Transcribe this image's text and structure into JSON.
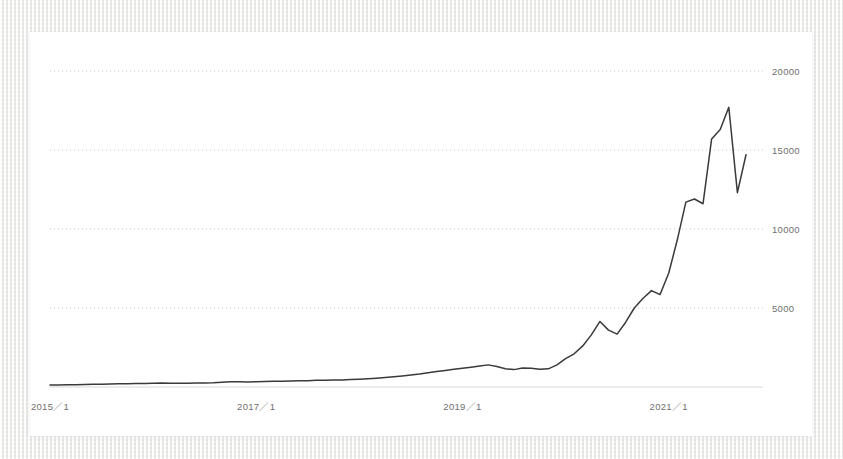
{
  "chart_data": {
    "type": "line",
    "title": "",
    "subtitle": "",
    "xlabel": "",
    "ylabel": "",
    "grid": true,
    "legend": false,
    "legend_position": "none",
    "line_color": "#3a3a3a",
    "gridline_color": "#c9c9c9",
    "background_color": "#ffffff",
    "page_background_color": "#f4f4f2",
    "ylim": [
      0,
      21000
    ],
    "y_ticks": [
      5000,
      10000,
      15000,
      20000
    ],
    "y_tick_labels": [
      "5000",
      "10000",
      "15000",
      "20000"
    ],
    "x_ticks": [
      "2015／1",
      "2017／1",
      "2019／1",
      "2021／1"
    ],
    "x_tick_labels": [
      "2015／1",
      "2017／1",
      "2019／1",
      "2021／1"
    ],
    "x_range": [
      "2015／1",
      "2021／10"
    ],
    "series": [
      {
        "name": "value",
        "x": [
          "2015/1",
          "2015/2",
          "2015/3",
          "2015/4",
          "2015/5",
          "2015/6",
          "2015/7",
          "2015/8",
          "2015/9",
          "2015/10",
          "2015/11",
          "2015/12",
          "2016/1",
          "2016/2",
          "2016/3",
          "2016/4",
          "2016/5",
          "2016/6",
          "2016/7",
          "2016/8",
          "2016/9",
          "2016/10",
          "2016/11",
          "2016/12",
          "2017/1",
          "2017/2",
          "2017/3",
          "2017/4",
          "2017/5",
          "2017/6",
          "2017/7",
          "2017/8",
          "2017/9",
          "2017/10",
          "2017/11",
          "2017/12",
          "2018/1",
          "2018/2",
          "2018/3",
          "2018/4",
          "2018/5",
          "2018/6",
          "2018/7",
          "2018/8",
          "2018/9",
          "2018/10",
          "2018/11",
          "2018/12",
          "2019/1",
          "2019/2",
          "2019/3",
          "2019/4",
          "2019/5",
          "2019/6",
          "2019/7",
          "2019/8",
          "2019/9",
          "2019/10",
          "2019/11",
          "2019/12",
          "2020/1",
          "2020/2",
          "2020/3",
          "2020/4",
          "2020/5",
          "2020/6",
          "2020/7",
          "2020/8",
          "2020/9",
          "2020/10",
          "2020/11",
          "2020/12",
          "2021/1",
          "2021/2",
          "2021/3",
          "2021/4",
          "2021/5",
          "2021/6",
          "2021/7",
          "2021/8",
          "2021/9",
          "2021/10"
        ],
        "values": [
          120,
          130,
          140,
          150,
          160,
          170,
          180,
          190,
          200,
          210,
          215,
          220,
          230,
          250,
          245,
          235,
          240,
          250,
          260,
          270,
          300,
          340,
          330,
          320,
          330,
          350,
          360,
          370,
          380,
          390,
          400,
          420,
          430,
          440,
          450,
          470,
          490,
          520,
          560,
          600,
          650,
          700,
          760,
          820,
          900,
          980,
          1050,
          1120,
          1180,
          1250,
          1330,
          1400,
          1300,
          1150,
          1100,
          1200,
          1180,
          1120,
          1150,
          1400,
          1800,
          2100,
          2600,
          3300,
          4150,
          3600,
          3350,
          4100,
          5000,
          5600,
          6100,
          5850,
          7200,
          9300,
          11700,
          11900,
          11600,
          15700,
          16300,
          17700,
          12300,
          14700
        ]
      }
    ]
  }
}
